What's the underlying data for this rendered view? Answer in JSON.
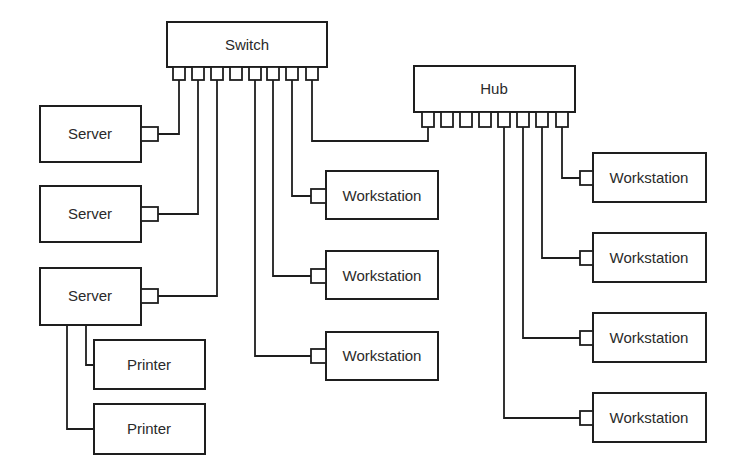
{
  "diagram": {
    "title": "",
    "colors": {
      "line": "#1e1e1e",
      "text": "#2a2a2a",
      "background": "#ffffff"
    },
    "nodes": {
      "switch": {
        "label": "Switch",
        "ports": 8
      },
      "hub": {
        "label": "Hub",
        "ports": 8
      },
      "servers": [
        {
          "label": "Server"
        },
        {
          "label": "Server"
        },
        {
          "label": "Server"
        }
      ],
      "printers": [
        {
          "label": "Printer"
        },
        {
          "label": "Printer"
        }
      ],
      "switch_workstations": [
        {
          "label": "Workstation"
        },
        {
          "label": "Workstation"
        },
        {
          "label": "Workstation"
        }
      ],
      "hub_workstations": [
        {
          "label": "Workstation"
        },
        {
          "label": "Workstation"
        },
        {
          "label": "Workstation"
        },
        {
          "label": "Workstation"
        }
      ]
    },
    "connections": [
      {
        "from": "switch.port1",
        "to": "servers.0"
      },
      {
        "from": "switch.port2",
        "to": "servers.1"
      },
      {
        "from": "switch.port3",
        "to": "servers.2"
      },
      {
        "from": "switch.port5",
        "to": "switch_workstations.2"
      },
      {
        "from": "switch.port6",
        "to": "switch_workstations.1"
      },
      {
        "from": "switch.port7",
        "to": "switch_workstations.0"
      },
      {
        "from": "switch.port8",
        "to": "hub.port1"
      },
      {
        "from": "hub.port5",
        "to": "hub_workstations.3"
      },
      {
        "from": "hub.port6",
        "to": "hub_workstations.2"
      },
      {
        "from": "hub.port7",
        "to": "hub_workstations.1"
      },
      {
        "from": "hub.port8",
        "to": "hub_workstations.0"
      },
      {
        "from": "servers.2",
        "to": "printers.0"
      },
      {
        "from": "servers.2",
        "to": "printers.1"
      }
    ]
  }
}
